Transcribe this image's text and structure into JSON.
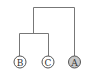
{
  "diagram": {
    "type": "dendrogram",
    "nodes": [
      {
        "id": "B",
        "label": "B",
        "fill": "#ffffff"
      },
      {
        "id": "C",
        "label": "C",
        "fill": "#ffffff"
      },
      {
        "id": "A",
        "label": "A",
        "fill": "#c8c8c8"
      }
    ],
    "clusters": [
      {
        "members": [
          "B",
          "C"
        ]
      },
      {
        "members": [
          "B",
          "C",
          "A"
        ]
      }
    ],
    "colors": {
      "line": "#777777",
      "node_stroke": "#555555"
    }
  }
}
